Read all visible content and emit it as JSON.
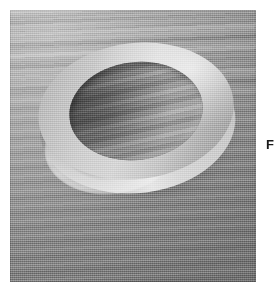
{
  "page": {
    "background_color": "#ffffff",
    "width": 278,
    "height": 293
  },
  "figure": {
    "alt_label": "grayscale photograph of an annular ring resting on a striated surface",
    "media_type": "photograph",
    "color_mode": "grayscale",
    "frame": {
      "left": 10,
      "top": 10,
      "width": 246,
      "height": 272
    },
    "palette": {
      "background_light": "#bcbcbc",
      "background_mid": "#9d9d9d",
      "background_dark": "#8a8a8a",
      "ring_highlight": "#e6e6e6",
      "ring_top_face": "#d6d6d6",
      "ring_shadow_side": "#7e7e7e",
      "bore_floor": "#9a9a9a",
      "bore_shadow": "#5f5f5f",
      "cast_shadow": "#6e6e6e"
    },
    "subject": {
      "name": "ring",
      "shape": "annulus",
      "view": "oblique",
      "tilt_degrees": -7,
      "outer_diameter_px": 196,
      "inner_diameter_px": 134,
      "wall_thickness_px": 31,
      "visible_height_px": 16,
      "light_direction": "upper-right",
      "highlight_location": "lower-left outer wall",
      "shadow_location": "lower-right"
    },
    "surface": {
      "name": "backdrop",
      "texture": "horizontal striations",
      "grain": "film grain"
    }
  },
  "caption": {
    "fragment_text": "F",
    "clipped": "true",
    "position": "right edge"
  }
}
